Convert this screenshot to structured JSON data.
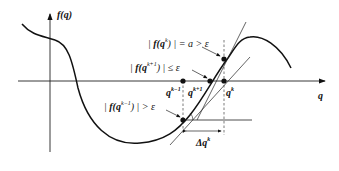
{
  "diagram": {
    "type": "newton-method-illustration",
    "axes": {
      "y_label": "f(q)",
      "x_label": "q"
    },
    "annotations": {
      "fqk": "|f(q^k)| = a > ε",
      "fqk1": "|f(q^{k+1})| ≤ ε",
      "fqkm1": "|f(q^{k-1})| > ε"
    },
    "points": {
      "q_km1": "q^{k-1}",
      "q_kp1": "q^{k+1}",
      "q_k": "q^k"
    },
    "delta": "Δq^k",
    "colors": {
      "ink": "#111111",
      "background": "#ffffff"
    }
  },
  "text": {
    "y_f": "f",
    "y_q": "(q)",
    "x_q": "q",
    "a1_pre": "|",
    "a1_f": "f(q",
    "a1_sup": "k",
    "a1_post": ") | = a > ε",
    "a2_pre": "|",
    "a2_f": "f(q",
    "a2_sup": "k+1",
    "a2_post": ") | ≤ ε",
    "a3_pre": "|",
    "a3_f": "f(q",
    "a3_sup": "k−1",
    "a3_post": ") | > ε",
    "p1": "q",
    "p1_sup": "k−1",
    "p2": "q",
    "p2_sup": "k+1",
    "p3": "q",
    "p3_sup": "k",
    "d": "Δq",
    "d_sup": "k"
  }
}
